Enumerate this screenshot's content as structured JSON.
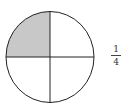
{
  "diagram": {
    "shape": "circle",
    "parts": 4,
    "shaded_parts": [
      "top-left"
    ],
    "shade_color": "#c8c8c8",
    "stroke_color": "#222222"
  },
  "fraction": {
    "numerator": "1",
    "denominator": "4"
  }
}
